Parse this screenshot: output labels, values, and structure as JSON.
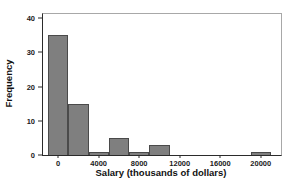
{
  "chart": {
    "xlabel": "Salary (thousands of dollars)",
    "ylabel": "Frequency"
  },
  "chart_data": {
    "type": "bar",
    "subtype": "histogram",
    "title": "",
    "xlabel": "Salary (thousands of dollars)",
    "ylabel": "Frequency",
    "bin_width": 2000,
    "bin_centers": [
      0,
      2000,
      4000,
      6000,
      8000,
      10000,
      12000,
      14000,
      16000,
      18000,
      20000
    ],
    "frequencies": [
      35,
      15,
      1,
      5,
      1,
      3,
      0,
      0,
      0,
      0,
      1
    ],
    "x_ticks": [
      0,
      4000,
      8000,
      12000,
      16000,
      20000
    ],
    "y_ticks": [
      0,
      10,
      20,
      30,
      40
    ],
    "xlim": [
      -1500,
      22000
    ],
    "ylim": [
      0,
      40
    ],
    "grid": false,
    "legend": "none",
    "colors": {
      "bar_fill": "#7f7f7f",
      "bar_border": "#4a4a4a",
      "axis_line": "#2b2b2b",
      "frame_line": "#a8a8a8",
      "text": "#111111",
      "background": "#ffffff"
    }
  }
}
